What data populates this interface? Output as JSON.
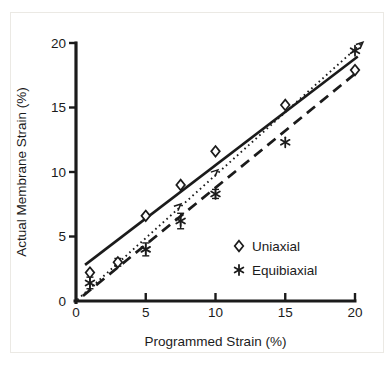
{
  "figure": {
    "ink_color": "#1b1b1b",
    "background": "#ffffff"
  },
  "chart_data": {
    "type": "scatter",
    "title": "",
    "xlabel": "Programmed Strain (%)",
    "ylabel": "Actual Membrane Strain (%)",
    "xlim": [
      0,
      20
    ],
    "ylim": [
      0,
      20
    ],
    "xticks": [
      0,
      5,
      10,
      15,
      20
    ],
    "yticks": [
      0,
      5,
      10,
      15,
      20
    ],
    "grid": false,
    "legend_position": "inside-lower-right",
    "series": [
      {
        "name": "Uniaxial",
        "marker": "open-diamond",
        "points": [
          {
            "x": 1,
            "y": 2.2
          },
          {
            "x": 3,
            "y": 3.0,
            "err": 0.3
          },
          {
            "x": 5,
            "y": 6.6
          },
          {
            "x": 7.5,
            "y": 9.0
          },
          {
            "x": 10,
            "y": 11.6
          },
          {
            "x": 15,
            "y": 15.2
          },
          {
            "x": 20,
            "y": 17.9
          }
        ],
        "fit_line": {
          "style": "solid",
          "x1": 0.65,
          "y1": 2.8,
          "x2": 20.2,
          "y2": 18.95
        }
      },
      {
        "name": "Equibiaxial",
        "marker": "asterisk",
        "points": [
          {
            "x": 1,
            "y": 1.4,
            "err": 0.45
          },
          {
            "x": 5,
            "y": 4.0,
            "err": 0.5
          },
          {
            "x": 7.5,
            "y": 6.2,
            "err": 0.6
          },
          {
            "x": 10,
            "y": 8.3,
            "err": 0.35
          },
          {
            "x": 15,
            "y": 12.3
          },
          {
            "x": 20,
            "y": 19.4
          }
        ],
        "fit_line": {
          "style": "long-dash",
          "x1": 0.5,
          "y1": 0.4,
          "x2": 20.1,
          "y2": 17.7
        }
      }
    ],
    "reference_line": {
      "name": "identity",
      "style": "dotted",
      "x1": 0.1,
      "y1": 0.1,
      "x2": 20.45,
      "y2": 19.95,
      "arrowheads": [
        {
          "x": 7.4,
          "y": 7.4
        },
        {
          "x": 10.05,
          "y": 10.05
        },
        {
          "x": 20.45,
          "y": 19.95
        }
      ]
    }
  }
}
